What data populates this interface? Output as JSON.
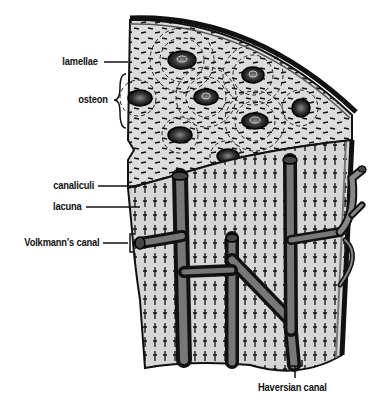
{
  "diagram": {
    "colors": {
      "bone_fill": "#d8d8d8",
      "outline": "#111111",
      "vessel": "#6a6a6a",
      "background": "#ffffff"
    },
    "labels": [
      {
        "id": "lamellae",
        "text": "lamellae"
      },
      {
        "id": "osteon",
        "text": "osteon"
      },
      {
        "id": "canaliculi",
        "text": "canaliculi"
      },
      {
        "id": "lacuna",
        "text": "lacuna"
      },
      {
        "id": "volkmanns-canal",
        "text": "Volkmann's canal"
      },
      {
        "id": "haversian-canal",
        "text": "Haversian canal"
      }
    ]
  }
}
